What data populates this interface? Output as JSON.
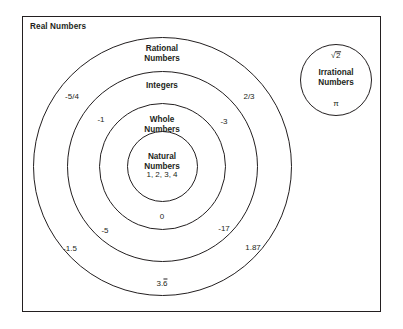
{
  "diagram": {
    "frame_title": "Real Numbers",
    "accent_color": "#231f20",
    "background_color": "#ffffff"
  },
  "sets": {
    "rational": {
      "line1": "Rational",
      "line2": "Numbers"
    },
    "integers": {
      "line1": "Integers"
    },
    "whole": {
      "line1": "Whole",
      "line2": "Numbers"
    },
    "natural": {
      "line1": "Natural",
      "line2": "Numbers"
    },
    "irrational": {
      "line1": "Irrational",
      "line2": "Numbers"
    }
  },
  "members": {
    "natural": "1, 2, 3, 4",
    "whole": "0",
    "integers_left_upper": "-1",
    "integers_right_upper": "-3",
    "integers_left_lower": "-5",
    "integers_right_lower": "-17",
    "rational_left_upper": "-5/4",
    "rational_right_upper": "2/3",
    "rational_left_lower": "-1.5",
    "rational_right_lower": "1.87",
    "rational_bottom_whole": "3.",
    "rational_bottom_repeat": "6",
    "irrational_top_radical": "√",
    "irrational_top_arg": "2",
    "irrational_bottom": "π"
  }
}
